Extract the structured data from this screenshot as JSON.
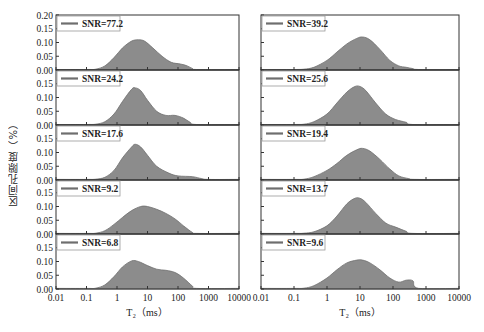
{
  "figure": {
    "ylabel": "区间孔隙度（%）",
    "xlabel_left": "T₂（ms）",
    "xlabel_right": "T₂（ms）",
    "fill_color": "#8c8c8c",
    "line_color": "#6e6e6e"
  },
  "chart_data": [
    {
      "type": "area",
      "title": "Left column",
      "xlabel": "T2 (ms)",
      "ylabel": "区间孔隙度（%）",
      "xscale": "log",
      "xlim": [
        0.01,
        10000
      ],
      "ylim": [
        0,
        0.2
      ],
      "x_ticks": [
        "0.01",
        "0.1",
        "1",
        "10",
        "100",
        "1000",
        "10000"
      ],
      "y_ticks": [
        "0.00",
        "0.05",
        "0.10",
        "0.15",
        "0.20"
      ],
      "series": [
        {
          "name": "SNR=77.2",
          "x": [
            0.01,
            0.1,
            0.2,
            0.4,
            0.8,
            1.5,
            3,
            5,
            8,
            15,
            30,
            60,
            120,
            200,
            300,
            400,
            10000
          ],
          "y": [
            0.002,
            0.002,
            0.003,
            0.015,
            0.045,
            0.08,
            0.105,
            0.11,
            0.105,
            0.08,
            0.05,
            0.028,
            0.022,
            0.015,
            0.005,
            0.002,
            0.002
          ]
        },
        {
          "name": "SNR=24.2",
          "x": [
            0.01,
            0.1,
            0.2,
            0.4,
            0.8,
            1.5,
            3,
            4,
            6,
            10,
            20,
            40,
            80,
            150,
            250,
            400,
            10000
          ],
          "y": [
            0.002,
            0.002,
            0.003,
            0.012,
            0.04,
            0.085,
            0.13,
            0.135,
            0.125,
            0.09,
            0.05,
            0.035,
            0.035,
            0.025,
            0.01,
            0.002,
            0.002
          ]
        },
        {
          "name": "SNR=17.6",
          "x": [
            0.01,
            0.1,
            0.2,
            0.4,
            0.8,
            1.5,
            3,
            4,
            6,
            10,
            20,
            50,
            100,
            300,
            600,
            1000,
            10000
          ],
          "y": [
            0.002,
            0.002,
            0.003,
            0.01,
            0.035,
            0.08,
            0.12,
            0.13,
            0.12,
            0.09,
            0.05,
            0.025,
            0.015,
            0.012,
            0.005,
            0.002,
            0.002
          ]
        },
        {
          "name": "SNR=9.2",
          "x": [
            0.01,
            0.1,
            0.2,
            0.4,
            0.8,
            1.5,
            3,
            6,
            10,
            20,
            40,
            80,
            150,
            300,
            400,
            10000
          ],
          "y": [
            0.002,
            0.002,
            0.003,
            0.012,
            0.035,
            0.06,
            0.085,
            0.1,
            0.1,
            0.09,
            0.075,
            0.055,
            0.03,
            0.005,
            0.002,
            0.002
          ]
        },
        {
          "name": "SNR=6.8",
          "x": [
            0.01,
            0.1,
            0.2,
            0.4,
            0.8,
            1.5,
            3,
            5,
            10,
            20,
            40,
            80,
            150,
            300,
            400,
            10000
          ],
          "y": [
            0.002,
            0.002,
            0.003,
            0.015,
            0.045,
            0.08,
            0.102,
            0.1,
            0.085,
            0.072,
            0.068,
            0.06,
            0.04,
            0.01,
            0.002,
            0.002
          ]
        }
      ]
    },
    {
      "type": "area",
      "title": "Right column",
      "xlabel": "T2 (ms)",
      "xscale": "log",
      "xlim": [
        0.01,
        10000
      ],
      "ylim": [
        0,
        0.2
      ],
      "x_ticks": [
        "0.01",
        "0.1",
        "1",
        "10",
        "100",
        "1000",
        "10000"
      ],
      "series": [
        {
          "name": "SNR=39.2",
          "x": [
            0.01,
            0.1,
            0.2,
            0.4,
            1,
            2,
            4,
            8,
            12,
            20,
            40,
            80,
            150,
            250,
            400,
            600,
            10000
          ],
          "y": [
            0.002,
            0.002,
            0.003,
            0.01,
            0.035,
            0.065,
            0.095,
            0.115,
            0.12,
            0.11,
            0.075,
            0.035,
            0.015,
            0.01,
            0.005,
            0.002,
            0.002
          ]
        },
        {
          "name": "SNR=25.6",
          "x": [
            0.01,
            0.1,
            0.2,
            0.4,
            1,
            2,
            4,
            7,
            10,
            15,
            30,
            60,
            120,
            250,
            400,
            10000
          ],
          "y": [
            0.002,
            0.002,
            0.003,
            0.012,
            0.04,
            0.08,
            0.12,
            0.14,
            0.14,
            0.125,
            0.08,
            0.04,
            0.02,
            0.01,
            0.002,
            0.002
          ]
        },
        {
          "name": "SNR=19.4",
          "x": [
            0.01,
            0.1,
            0.2,
            0.4,
            1,
            2,
            4,
            8,
            12,
            20,
            40,
            80,
            150,
            300,
            500,
            10000
          ],
          "y": [
            0.002,
            0.002,
            0.003,
            0.012,
            0.035,
            0.06,
            0.09,
            0.11,
            0.115,
            0.105,
            0.075,
            0.04,
            0.015,
            0.005,
            0.002,
            0.002
          ]
        },
        {
          "name": "SNR=13.7",
          "x": [
            0.01,
            0.1,
            0.2,
            0.4,
            1,
            2,
            4,
            7,
            10,
            15,
            30,
            60,
            120,
            250,
            400,
            10000
          ],
          "y": [
            0.002,
            0.002,
            0.003,
            0.008,
            0.03,
            0.065,
            0.11,
            0.13,
            0.13,
            0.115,
            0.075,
            0.04,
            0.025,
            0.01,
            0.002,
            0.002
          ]
        },
        {
          "name": "SNR=9.6",
          "x": [
            0.01,
            0.1,
            0.2,
            0.4,
            1,
            2,
            4,
            8,
            12,
            20,
            40,
            80,
            150,
            250,
            400,
            600,
            10000
          ],
          "y": [
            0.002,
            0.002,
            0.003,
            0.012,
            0.04,
            0.07,
            0.095,
            0.105,
            0.105,
            0.095,
            0.07,
            0.04,
            0.025,
            0.032,
            0.03,
            0.002,
            0.002
          ]
        }
      ]
    }
  ],
  "layout": {
    "columns": [
      {
        "x0": 56,
        "decade": 30.5
      },
      {
        "x0": 261,
        "decade": 33
      }
    ],
    "rows": [
      15,
      70,
      125,
      180,
      234,
      289
    ],
    "y_tick_labels_rows": [
      [
        "0.20",
        "0.15",
        "0.10",
        "0.05",
        "0.00"
      ],
      [
        "0.15",
        "0.10",
        "0.05",
        "0.00"
      ],
      [
        "0.15",
        "0.10",
        "0.05",
        "0.00"
      ],
      [
        "0.15",
        "0.10",
        "0.05",
        "0.00"
      ],
      [
        "0.15",
        "0.10",
        "0.05",
        "0.00"
      ]
    ]
  }
}
